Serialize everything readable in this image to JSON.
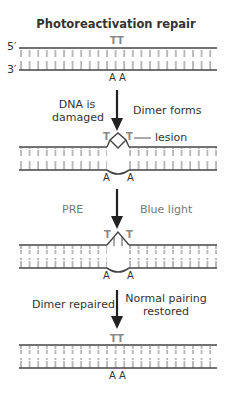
{
  "title": "Photoreactivation repair",
  "strand_labels": {
    "five_prime": "5′",
    "three_prime": "3′"
  },
  "stages": [
    {
      "name": "normal",
      "top_bases": "TT",
      "bottom_bases": "A A"
    },
    {
      "name": "dimer",
      "top_base_left": "T",
      "top_base_right": "T",
      "bottom_base_left": "A",
      "bottom_base_right": "A",
      "annotation": "lesion"
    },
    {
      "name": "pre-bound",
      "top_base_left": "T",
      "top_base_right": "T",
      "bottom_base_left": "A",
      "bottom_base_right": "A"
    },
    {
      "name": "repaired",
      "top_bases": "TT",
      "bottom_bases": "A A"
    }
  ],
  "steps": [
    {
      "left": "DNA is\ndamaged",
      "left_line1": "DNA is",
      "left_line2": "damaged",
      "right": "Dimer forms"
    },
    {
      "left": "PRE",
      "right": "Blue light"
    },
    {
      "left": "Dimer repaired",
      "right_line1": "Normal pairing",
      "right_line2": "restored"
    }
  ]
}
